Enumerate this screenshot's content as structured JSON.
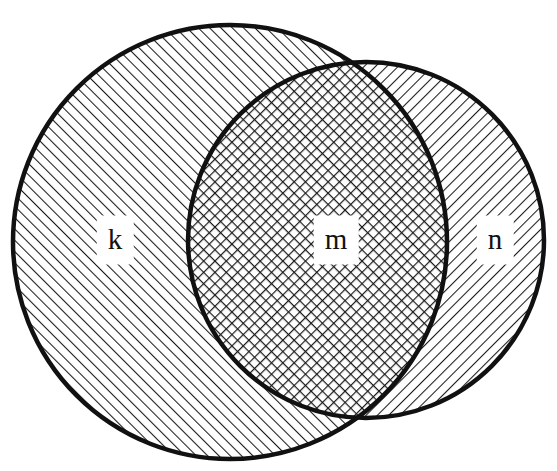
{
  "diagram": {
    "type": "venn-diagram",
    "title": "",
    "background_color": "#ffffff",
    "stroke_color": "#111111",
    "hatch_color": "#1a1a1a",
    "canvas": {
      "width": 557,
      "height": 471
    },
    "sets": [
      {
        "id": "k",
        "label": "k",
        "role": "left-set-only",
        "shape": "circle",
        "cx": 230,
        "cy": 242,
        "r": 217,
        "fill_pattern": "diagonal-hatch-forward",
        "hatch_angle_deg": 45,
        "label_x": 115,
        "label_y": 240
      },
      {
        "id": "n",
        "label": "n",
        "role": "right-set-only",
        "shape": "circle",
        "cx": 366,
        "cy": 240,
        "r": 178,
        "fill_pattern": "diagonal-hatch-backward",
        "hatch_angle_deg": -45,
        "label_x": 495,
        "label_y": 240
      }
    ],
    "intersection": {
      "id": "m",
      "label": "m",
      "role": "intersection-region",
      "fill_pattern": "cross-hatch",
      "label_x": 336,
      "label_y": 240
    },
    "labels": [
      {
        "id": "label-k",
        "text": "k",
        "x": 115,
        "y": 240
      },
      {
        "id": "label-m",
        "text": "m",
        "x": 336,
        "y": 240
      },
      {
        "id": "label-n",
        "text": "n",
        "x": 495,
        "y": 240
      }
    ]
  }
}
